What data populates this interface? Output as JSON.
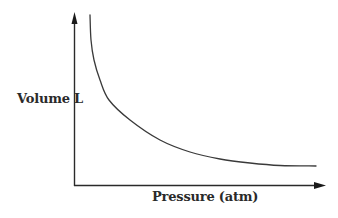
{
  "chart_data": {
    "type": "line",
    "title": "",
    "xlabel": "Pressure (atm)",
    "ylabel": "Volume L",
    "grid": false,
    "legend": null,
    "ticks": {
      "x": [],
      "y": []
    },
    "series": [
      {
        "name": "V vs P",
        "relation": "V = k / P",
        "points_px": [
          [
            90,
            15
          ],
          [
            91,
            40
          ],
          [
            94,
            60
          ],
          [
            100,
            80
          ],
          [
            109,
            100
          ],
          [
            130,
            120
          ],
          [
            160,
            140
          ],
          [
            190,
            152
          ],
          [
            220,
            159
          ],
          [
            250,
            163
          ],
          [
            280,
            165.5
          ],
          [
            316,
            166
          ]
        ]
      }
    ],
    "colors": {
      "axis": "#2a2a2a",
      "curve": "#3a3a3a",
      "text": "#2a2a2a"
    }
  },
  "labels": {
    "y_axis": "Volume L",
    "x_axis": "Pressure (atm)"
  }
}
